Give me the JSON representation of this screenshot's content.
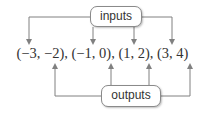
{
  "diagram": {
    "inputs_label": "inputs",
    "outputs_label": "outputs",
    "pairs_text": "(−3, −2), (−1, 0), (1, 2), (3, 4)",
    "pairs": [
      {
        "input": "−3",
        "output": "−2"
      },
      {
        "input": "−1",
        "output": "0"
      },
      {
        "input": "1",
        "output": "2"
      },
      {
        "input": "3",
        "output": "4"
      }
    ],
    "colors": {
      "line": "#808080",
      "text": "#333333",
      "box_border": "#8a8a8a"
    }
  }
}
